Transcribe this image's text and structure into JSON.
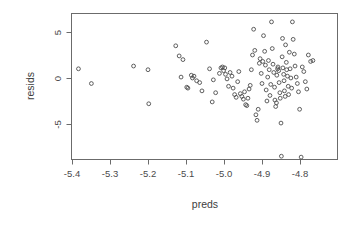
{
  "chart_data": {
    "type": "scatter",
    "title": "",
    "xlabel": "preds",
    "ylabel": "resids",
    "grid": false,
    "legend": null,
    "xlim": [
      -5.44,
      -4.755
    ],
    "ylim": [
      -9.6,
      6.6
    ],
    "xticks": [
      -5.4,
      -5.3,
      -5.2,
      -5.1,
      -5.0,
      -4.9,
      -4.8
    ],
    "xticklabels": [
      "-5.4",
      "-5.3",
      "-5.2",
      "-5.1",
      "-5.0",
      "-4.9",
      "-4.8"
    ],
    "yticks": [
      5,
      0,
      -5
    ],
    "yticklabels": [
      "5",
      "0",
      "-5"
    ],
    "point_marker": "open-circle",
    "point_color": "#4d4d4d",
    "n_points": 118,
    "x": [
      -5.383,
      -5.349,
      -5.238,
      -5.2,
      -5.198,
      -5.127,
      -5.118,
      -5.113,
      -5.108,
      -5.098,
      -5.095,
      -5.086,
      -5.083,
      -5.079,
      -5.072,
      -5.064,
      -5.058,
      -5.046,
      -5.038,
      -5.031,
      -5.028,
      -5.022,
      -5.012,
      -5.008,
      -5.004,
      -5.001,
      -4.998,
      -4.996,
      -4.992,
      -4.988,
      -4.984,
      -4.979,
      -4.976,
      -4.972,
      -4.968,
      -4.964,
      -4.961,
      -4.957,
      -4.953,
      -4.949,
      -4.946,
      -4.943,
      -4.94,
      -4.937,
      -4.934,
      -4.931,
      -4.928,
      -4.925,
      -4.922,
      -4.919,
      -4.916,
      -4.913,
      -4.91,
      -4.907,
      -4.905,
      -4.902,
      -4.9,
      -4.898,
      -4.896,
      -4.893,
      -4.891,
      -4.889,
      -4.887,
      -4.885,
      -4.883,
      -4.881,
      -4.879,
      -4.877,
      -4.875,
      -4.873,
      -4.871,
      -4.869,
      -4.867,
      -4.866,
      -4.864,
      -4.862,
      -4.861,
      -4.859,
      -4.858,
      -4.856,
      -4.855,
      -4.853,
      -4.852,
      -4.85,
      -4.849,
      -4.847,
      -4.846,
      -4.845,
      -4.843,
      -4.842,
      -4.841,
      -4.839,
      -4.838,
      -4.836,
      -4.835,
      -4.833,
      -4.831,
      -4.83,
      -4.828,
      -4.826,
      -4.824,
      -4.822,
      -4.82,
      -4.818,
      -4.815,
      -4.813,
      -4.81,
      -4.807,
      -4.804,
      -4.801,
      -4.797,
      -4.794,
      -4.79,
      -4.786,
      -4.782,
      -4.778,
      -4.772,
      -4.766
    ],
    "y": [
      1.0,
      -0.6,
      1.3,
      0.9,
      -2.8,
      3.5,
      2.4,
      0.1,
      2.0,
      -1.0,
      -1.1,
      0.3,
      0.0,
      0.2,
      -0.3,
      -0.5,
      -1.4,
      3.9,
      1.0,
      -2.6,
      -0.2,
      -1.6,
      0.5,
      1.1,
      1.2,
      0.8,
      1.1,
      0.4,
      -0.1,
      -0.9,
      0.6,
      0.2,
      -1.1,
      -1.8,
      -2.1,
      -0.4,
      0.7,
      -1.7,
      -2.0,
      -2.3,
      -1.5,
      -2.9,
      -3.0,
      -2.2,
      -1.2,
      -0.8,
      0.9,
      2.5,
      5.3,
      3.0,
      -4.0,
      -4.6,
      -3.4,
      1.6,
      2.1,
      0.5,
      -0.6,
      1.8,
      4.6,
      2.9,
      1.4,
      -1.3,
      -2.5,
      0.1,
      1.9,
      0.9,
      -1.9,
      -0.7,
      6.1,
      3.2,
      1.5,
      0.6,
      -1.0,
      -2.4,
      -3.1,
      -2.7,
      0.3,
      1.0,
      1.2,
      0.8,
      -0.5,
      -1.6,
      -2.2,
      -4.9,
      -8.5,
      2.3,
      4.3,
      1.1,
      0.4,
      -0.3,
      -1.4,
      -2.0,
      3.6,
      1.7,
      0.9,
      0.2,
      -0.9,
      -1.8,
      2.8,
      1.0,
      0.0,
      -1.1,
      6.1,
      4.2,
      2.6,
      1.3,
      0.1,
      -0.6,
      -1.5,
      -3.4,
      -8.6,
      1.2,
      0.7,
      -0.4,
      -1.2,
      2.5,
      1.8,
      1.9
    ]
  },
  "axes": {
    "x_title": "preds",
    "y_title": "resids"
  }
}
